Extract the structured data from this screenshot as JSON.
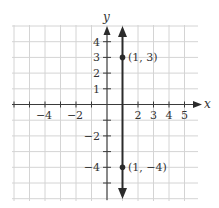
{
  "chart_data": {
    "type": "line",
    "title": "",
    "xlabel": "x",
    "ylabel": "y",
    "xlim": [
      -6.5,
      5.5
    ],
    "ylim": [
      -6.2,
      5
    ],
    "grid": true,
    "x_tick_labels": [
      "-4",
      "-2",
      "2",
      "3",
      "4",
      "5"
    ],
    "x_tick_values": [
      -4,
      -2,
      2,
      3,
      4,
      5
    ],
    "y_tick_labels": [
      "4",
      "3",
      "2",
      "1",
      "-2",
      "-4"
    ],
    "y_tick_values": [
      4,
      3,
      2,
      1,
      -2,
      -4
    ],
    "series": [
      {
        "name": "vertical line x = 1",
        "description": "Vertical line through x = 1 with arrows at both ends",
        "x": [
          1,
          1
        ],
        "y": [
          -6,
          4.8
        ]
      }
    ],
    "points": [
      {
        "x": 1,
        "y": 3,
        "label": "(1, 3)"
      },
      {
        "x": 1,
        "y": -4,
        "label": "(1, −4)"
      }
    ]
  },
  "labels": {
    "x_axis": "x",
    "y_axis": "y",
    "x_ticks": [
      {
        "value": -4,
        "text": "−4"
      },
      {
        "value": -2,
        "text": "−2"
      },
      {
        "value": 2,
        "text": "2"
      },
      {
        "value": 3,
        "text": "3"
      },
      {
        "value": 4,
        "text": "4"
      },
      {
        "value": 5,
        "text": "5"
      }
    ],
    "y_ticks": [
      {
        "value": 4,
        "text": "4"
      },
      {
        "value": 3,
        "text": "3"
      },
      {
        "value": 2,
        "text": "2"
      },
      {
        "value": 1,
        "text": "1"
      },
      {
        "value": -2,
        "text": "−2"
      },
      {
        "value": -4,
        "text": "−4"
      }
    ],
    "point_a": "(1, 3)",
    "point_b": "(1, −4)"
  }
}
